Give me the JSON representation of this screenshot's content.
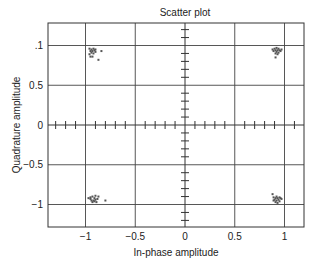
{
  "chart_data": {
    "type": "scatter",
    "title": "Scatter plot",
    "xlabel": "In-phase amplitude",
    "ylabel": "Quadrature amplitude",
    "xlim": [
      -1.38,
      1.2
    ],
    "ylim": [
      -1.28,
      1.28
    ],
    "xticks": [
      -1,
      -0.5,
      0,
      0.5,
      1
    ],
    "xtick_labels": [
      "−1",
      "−0.5",
      "0",
      "0.5",
      "1"
    ],
    "yticks": [
      1,
      0.5,
      0,
      -0.5,
      -1
    ],
    "ytick_labels": [
      ".1",
      "0.5",
      "0",
      "−0.5",
      "−1"
    ],
    "grid": true,
    "legend": null,
    "center_axes_with_minor_ticks": true,
    "minor_tick_step_x": 0.1,
    "minor_tick_step_y": 0.1,
    "series": [
      {
        "name": "QPSK symbols",
        "color": "#555555",
        "points": [
          [
            -0.96,
            0.96
          ],
          [
            -0.94,
            0.95
          ],
          [
            -0.92,
            0.96
          ],
          [
            -0.95,
            0.93
          ],
          [
            -0.93,
            0.93
          ],
          [
            -0.91,
            0.94
          ],
          [
            -0.9,
            0.92
          ],
          [
            -0.94,
            0.91
          ],
          [
            -0.96,
            0.89
          ],
          [
            -0.92,
            0.9
          ],
          [
            -0.84,
            0.93
          ],
          [
            -0.95,
            0.86
          ],
          [
            -0.93,
            0.86
          ],
          [
            -0.87,
            0.82
          ],
          [
            -0.9,
            0.95
          ],
          [
            0.88,
            0.95
          ],
          [
            0.9,
            0.96
          ],
          [
            0.92,
            0.97
          ],
          [
            0.94,
            0.96
          ],
          [
            0.91,
            0.94
          ],
          [
            0.93,
            0.94
          ],
          [
            0.95,
            0.94
          ],
          [
            0.89,
            0.93
          ],
          [
            0.92,
            0.92
          ],
          [
            0.94,
            0.91
          ],
          [
            0.96,
            0.93
          ],
          [
            0.91,
            0.9
          ],
          [
            0.93,
            0.89
          ],
          [
            0.91,
            0.85
          ],
          [
            0.97,
            0.95
          ],
          [
            -0.97,
            -0.92
          ],
          [
            -0.95,
            -0.93
          ],
          [
            -0.93,
            -0.9
          ],
          [
            -0.91,
            -0.92
          ],
          [
            -0.9,
            -0.89
          ],
          [
            -0.94,
            -0.95
          ],
          [
            -0.92,
            -0.95
          ],
          [
            -0.9,
            -0.94
          ],
          [
            -0.88,
            -0.93
          ],
          [
            -0.87,
            -0.9
          ],
          [
            -0.89,
            -0.97
          ],
          [
            -0.93,
            -0.97
          ],
          [
            -0.8,
            -0.95
          ],
          [
            -0.95,
            -0.91
          ],
          [
            -0.91,
            -0.96
          ],
          [
            0.88,
            -0.87
          ],
          [
            0.89,
            -0.91
          ],
          [
            0.91,
            -0.92
          ],
          [
            0.93,
            -0.92
          ],
          [
            0.95,
            -0.91
          ],
          [
            0.9,
            -0.94
          ],
          [
            0.92,
            -0.95
          ],
          [
            0.94,
            -0.94
          ],
          [
            0.96,
            -0.92
          ],
          [
            0.91,
            -0.97
          ],
          [
            0.93,
            -0.98
          ],
          [
            0.95,
            -0.96
          ],
          [
            0.89,
            -0.95
          ],
          [
            0.97,
            -0.93
          ],
          [
            0.92,
            -0.9
          ]
        ]
      }
    ]
  }
}
